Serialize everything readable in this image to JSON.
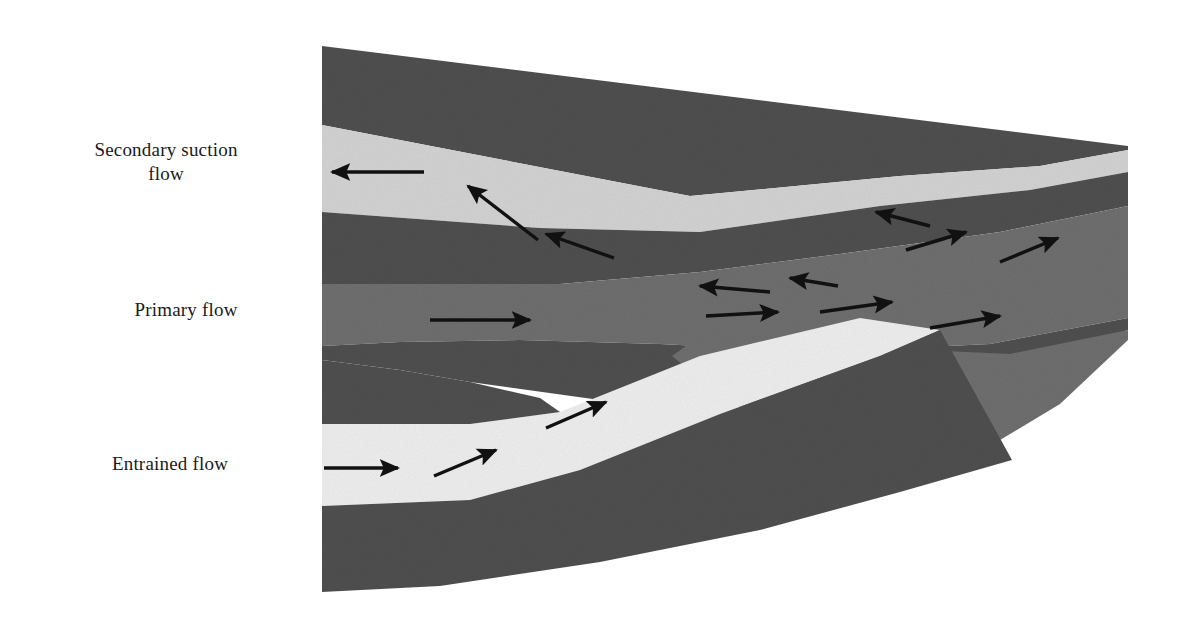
{
  "figure": {
    "background_color": "#ffffff"
  },
  "labels": [
    {
      "id": "secondary",
      "text": "Secondary suction\nflow",
      "name": "label-secondary-suction-flow"
    },
    {
      "id": "primary",
      "text": "Primary flow",
      "name": "label-primary-flow"
    },
    {
      "id": "entrained",
      "text": "Entrained flow",
      "name": "label-entrained-flow"
    }
  ],
  "colors": {
    "wall_dark": "#4f4f4f",
    "wall_dark_alt": "#4a4a4a",
    "body_medium": "#6e6e6e",
    "channel_light": "#d2d2d2",
    "channel_bright": "#ededed",
    "arrow": "#111111",
    "background": "#ffffff",
    "text": "#1a1a1a"
  },
  "regions": [
    {
      "name": "upper-outer-wall",
      "role": "dark wall above secondary suction channel",
      "fill": "wall_dark"
    },
    {
      "name": "secondary-suction-channel",
      "role": "light passage carrying secondary suction flow",
      "fill": "channel_light"
    },
    {
      "name": "upper-inner-wall",
      "role": "dark wall between secondary channel and primary core",
      "fill": "wall_dark"
    },
    {
      "name": "primary-core-body",
      "role": "medium gray central primary flow body",
      "fill": "body_medium"
    },
    {
      "name": "lower-inner-wall",
      "role": "dark wall between primary core and entrained channel",
      "fill": "wall_dark"
    },
    {
      "name": "entrained-channel",
      "role": "bright passage carrying entrained flow",
      "fill": "channel_bright"
    },
    {
      "name": "lower-outer-wall",
      "role": "dark wedge below entrained channel",
      "fill": "wall_dark"
    },
    {
      "name": "mixing-region",
      "role": "downstream region where streams combine and recirculate",
      "fill": "body_medium"
    }
  ],
  "flow_arrows": [
    {
      "name": "arrow-secondary-reverse-1",
      "direction": "left",
      "region": "secondary-suction-channel"
    },
    {
      "name": "arrow-secondary-reverse-2",
      "direction": "down-left",
      "region": "secondary-suction-channel"
    },
    {
      "name": "arrow-secondary-reverse-3",
      "direction": "down-left",
      "region": "secondary-suction-channel"
    },
    {
      "name": "arrow-primary-forward-1",
      "direction": "right",
      "region": "primary-core-body"
    },
    {
      "name": "arrow-mixing-reverse-1",
      "direction": "left",
      "region": "mixing-region"
    },
    {
      "name": "arrow-mixing-reverse-2",
      "direction": "left",
      "region": "mixing-region"
    },
    {
      "name": "arrow-mixing-reverse-3",
      "direction": "left",
      "region": "mixing-region"
    },
    {
      "name": "arrow-mixing-forward-1",
      "direction": "right",
      "region": "mixing-region"
    },
    {
      "name": "arrow-mixing-forward-2",
      "direction": "right",
      "region": "mixing-region"
    },
    {
      "name": "arrow-mixing-forward-3",
      "direction": "right",
      "region": "mixing-region"
    },
    {
      "name": "arrow-exit-up-right-1",
      "direction": "up-right",
      "region": "mixing-region"
    },
    {
      "name": "arrow-exit-up-right-2",
      "direction": "up-right",
      "region": "mixing-region"
    },
    {
      "name": "arrow-entrained-forward-1",
      "direction": "right",
      "region": "entrained-channel"
    },
    {
      "name": "arrow-entrained-forward-2",
      "direction": "up-right",
      "region": "entrained-channel"
    },
    {
      "name": "arrow-entrained-forward-3",
      "direction": "up-right",
      "region": "entrained-channel"
    }
  ]
}
